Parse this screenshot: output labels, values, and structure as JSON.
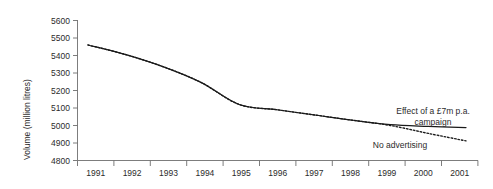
{
  "chart_data": {
    "type": "line",
    "title": "",
    "subtitle": "",
    "xlabel": "",
    "ylabel": "Volume (million litres)",
    "ylim": [
      4800,
      5600
    ],
    "ytick_step": 100,
    "yticks": [
      "5600",
      "5500",
      "5400",
      "5300",
      "5200",
      "5100",
      "5000",
      "4900",
      "4800"
    ],
    "ytick_values": [
      5600,
      5500,
      5400,
      5300,
      5200,
      5100,
      5000,
      4900,
      4800
    ],
    "categories": [
      "1991",
      "1992",
      "1993",
      "1994",
      "1995",
      "1996",
      "1997",
      "1998",
      "1999",
      "2000",
      "2001"
    ],
    "grid": false,
    "legend_position": "inline-annotations",
    "series": [
      {
        "name": "Effect of a £7m p.a. campaign",
        "style": "solid",
        "color": "#1a1a1a",
        "values": [
          5460,
          5405,
          5335,
          5245,
          5120,
          5090,
          5060,
          5030,
          5005,
          4995,
          4988
        ]
      },
      {
        "name": "No advertising",
        "style": "dotted",
        "color": "#1a1a1a",
        "values": [
          5460,
          5405,
          5335,
          5245,
          5120,
          5090,
          5060,
          5030,
          5000,
          4955,
          4912
        ]
      }
    ],
    "annotations": [
      {
        "id": "campaign-annotation",
        "line1": "Effect of a £7m p.a.",
        "line2": "campaign"
      },
      {
        "id": "no-advertising-annotation",
        "text": "No advertising"
      }
    ]
  }
}
